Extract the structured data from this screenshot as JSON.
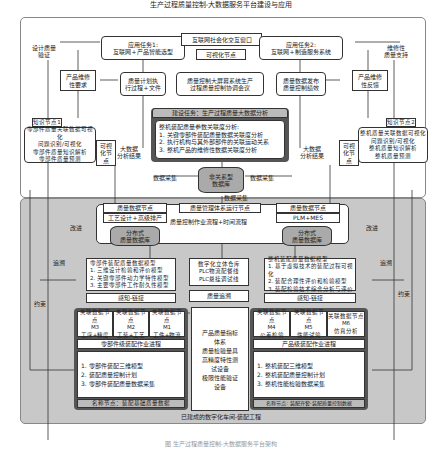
{
  "top_panel": {
    "title": "生产过程质量控制-大数据服务平台建设与应用",
    "left_side_label": "设计质量\n验证",
    "right_side_label": "维修性\n质量支持",
    "task1": {
      "title": "应用任务1:",
      "sub": "互联网+产品智能选型"
    },
    "window": {
      "title": "互联网社会化交互窗口",
      "node": "可视化节点"
    },
    "task2": {
      "title": "应用任务2:",
      "sub": "互联网+制造服务系统"
    },
    "maint_req": "产品维修\n性要求",
    "maint_fb": "产品维修\n性反馈",
    "plan_exec": "质量计划执\n行过程+文件",
    "big_screen": "质量控制大屏幕系统生产\n过程质量控制协调会议",
    "data_publish": "质量数据发布\n质量控制绩效",
    "build_task": {
      "title": "建设任务：生产过程质量大数据分析",
      "heading": "整机装配质量参数关联度分析:",
      "items": [
        "1. 关键零部件装配质量数据关联度分析",
        "2. 执行机构与其外部部件的关联运动关系",
        "3. 整机产品的维修性数据关联度分析"
      ]
    },
    "knowledge1": {
      "tag": "知识节点1",
      "lines": [
        "零部件质量关联数据可视化",
        "问题识别/可视化",
        "零部件质量知识解析",
        "零部件质量预测"
      ]
    },
    "knowledge2": {
      "tag": "知识节点2",
      "lines": [
        "整机质量关联数据可视化",
        "问题识别/可视化",
        "整机质量知识解析",
        "整机质量预测"
      ]
    },
    "vis_node": "可视\n化节\n点",
    "bigdata_result": "大数据\n分析结果",
    "nosql_db": "非关系型\n数据库",
    "data_collect": "数据采集"
  },
  "middle": {
    "quality_node": "质量数据节点",
    "mgmt_node": "质量管理体系运行节点",
    "process_design": "工艺设计+高级排产",
    "plm_mes": "PLM+MES",
    "flow": "质量控制作业流程+时间流程",
    "dist_db": "分布式\n质量数据库"
  },
  "bottom_panel": {
    "improve": "改进",
    "trace": "追溯",
    "constraint": "约束",
    "part_model": {
      "title": "零部件装配质量数据模型",
      "items": [
        "1. 三维设计检验和评价模型",
        "2. 关键零部件动力学特性模型",
        "3. 主要零部件工作耐久性模型"
      ]
    },
    "warehouse": "数字化立体仓库\nPLC物流配餐线\nPLC悬挂调试线",
    "machine_model": {
      "title": "整机装配质量数据模型",
      "items": [
        "1. 基于虚拟技术的装配过程可视化",
        "2. 装配合理性评价和检验模型",
        "3. 装配检验技术综合分析与评价"
      ]
    },
    "sense_link": "感知-链接",
    "quality_trace": "质量追溯",
    "assoc_tag": "关联数据节点",
    "left_nodes": [
      {
        "id": "M3",
        "desc": "工序+精度"
      },
      {
        "id": "M2",
        "desc": "工装+工艺"
      },
      {
        "id": "M1",
        "desc": "工件+物流"
      }
    ],
    "right_nodes": [
      {
        "id": "M4",
        "desc": "公差检验"
      },
      {
        "id": "M5",
        "desc": "性能试验"
      },
      {
        "id": "M6",
        "desc": "仿真分析"
      }
    ],
    "indicators": "产品质量指标\n体系\n质量检验量具\n高精度特性测\n试设备\n极限性能验证\n设备",
    "part_progress": "零部件级装配作业进程",
    "prod_progress": "产品级装配作业进程",
    "part_list": [
      "1. 零部件装配三维模型",
      "2. 装配质量控制计划",
      "3. 零部件装配质量数据采集"
    ],
    "prod_list": [
      "1. 整机装配三维模型",
      "2. 整机装配质量控制计划",
      "3. 整机性能检验数据采集"
    ],
    "name_node_left": "名称节点：装配基础质量数据",
    "name_node_right": "名称节点: 装配齐套-装配质量控制数据",
    "footer": "已建成的数字化车间-装配工程"
  },
  "caption": "图 生产过程质量控制-大数据服务平台架构"
}
